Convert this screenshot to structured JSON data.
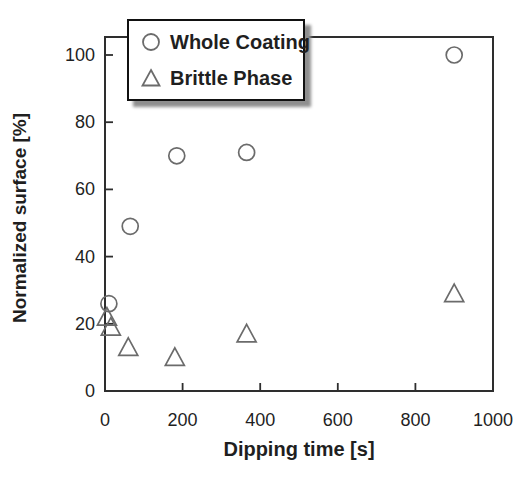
{
  "chart_data": {
    "type": "scatter",
    "title": "",
    "xlabel": "Dipping time [s]",
    "ylabel": "Normalized surface [%]",
    "xlim": [
      0,
      1000
    ],
    "ylim": [
      0,
      105
    ],
    "xticks": [
      0,
      200,
      400,
      600,
      800,
      1000
    ],
    "yticks": [
      0,
      20,
      40,
      60,
      80,
      100
    ],
    "grid": false,
    "legend_position": "upper-left-inside",
    "series": [
      {
        "name": "Whole Coating",
        "marker": "circle",
        "points": [
          [
            10,
            26
          ],
          [
            65,
            49
          ],
          [
            185,
            70
          ],
          [
            365,
            71
          ],
          [
            900,
            100
          ]
        ]
      },
      {
        "name": "Brittle Phase",
        "marker": "triangle",
        "points": [
          [
            5,
            22
          ],
          [
            15,
            19
          ],
          [
            60,
            13
          ],
          [
            180,
            10
          ],
          [
            365,
            17
          ],
          [
            900,
            29
          ]
        ]
      }
    ],
    "colors": {
      "axis": "#2e2e2e",
      "text": "#1f1f1f",
      "marker_stroke": "#6b6b6b",
      "legend_border": "#111111",
      "legend_shadow": "#8f8f8f",
      "background": "#ffffff"
    }
  }
}
